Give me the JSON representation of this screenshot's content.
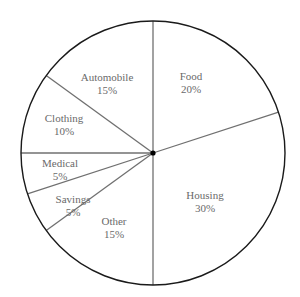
{
  "chart_data": {
    "type": "pie",
    "title": "",
    "start_angle_deg": 0,
    "direction": "clockwise",
    "categories": [
      "Food",
      "Housing",
      "Other",
      "Savings",
      "Medical",
      "Clothing",
      "Automobile"
    ],
    "values": [
      20,
      30,
      15,
      5,
      5,
      10,
      15
    ],
    "value_labels": [
      "20%",
      "30%",
      "15%",
      "5%",
      "5%",
      "10%",
      "15%"
    ],
    "legend": "none",
    "center_dot": true
  },
  "colors": {
    "slice_fill": "#ffffff",
    "outline": "#1a1a1a",
    "divider": "#707070",
    "label_text": "#6a6a6a"
  }
}
